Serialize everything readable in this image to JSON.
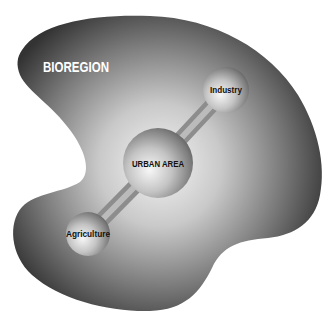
{
  "diagram": {
    "region_label": "BIOREGION",
    "nodes": [
      {
        "id": "urban",
        "label": "URBAN AREA"
      },
      {
        "id": "industry",
        "label": "Industry"
      },
      {
        "id": "agriculture",
        "label": "Agriculture"
      }
    ],
    "connections": [
      {
        "from": "urban",
        "to": "industry"
      },
      {
        "from": "urban",
        "to": "agriculture"
      }
    ],
    "colors": {
      "background": "#ffffff",
      "region_dark": "#3a3a3a",
      "region_light": "#f2f2f2",
      "label_text_light": "#ffffff",
      "label_text_dark": "#111111"
    }
  }
}
